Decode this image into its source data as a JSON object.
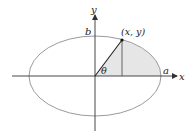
{
  "diagram": {
    "type": "ellipse-parametric",
    "labels": {
      "y_axis": "y",
      "x_axis": "x",
      "semi_minor": "b",
      "semi_major": "a",
      "point": "(x, y)",
      "angle": "θ"
    },
    "colors": {
      "ellipse_stroke": "#9a9a9a",
      "axis": "#333333",
      "shaded_region": "#e6e6e6",
      "radius_line": "#222222"
    }
  }
}
